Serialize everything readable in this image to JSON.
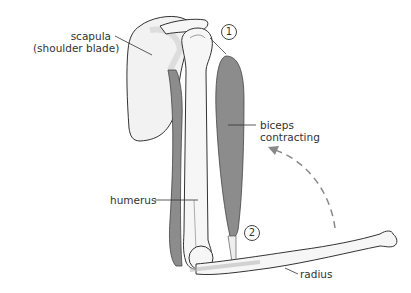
{
  "diagram": {
    "type": "anatomy",
    "labels": {
      "scapula_line1": "scapula",
      "scapula_line2": "(shoulder blade)",
      "biceps_line1": "biceps",
      "biceps_line2": "contracting",
      "humerus": "humerus",
      "radius": "radius"
    },
    "markers": {
      "one": "1",
      "two": "2"
    },
    "colors": {
      "muscle": "#8c8c8c",
      "bone": "#f4f4f4",
      "bone_shade": "#d9d9d9",
      "outline": "#333333",
      "arrow": "#888888"
    }
  }
}
